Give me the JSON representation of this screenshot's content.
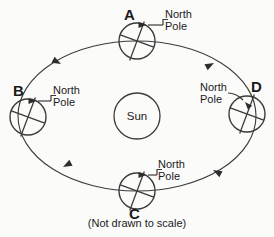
{
  "diagram": {
    "caption": "(Not drawn to scale)",
    "center_body": {
      "label": "Sun",
      "cx": 137,
      "cy": 116,
      "r": 23
    },
    "orbit": {
      "shape": "ellipse",
      "cx": 137,
      "cy": 116,
      "rx": 119,
      "ry": 75,
      "direction": "counterclockwise"
    },
    "positions": [
      {
        "letter": "A",
        "pole_label": "North\nPole",
        "cx": 137,
        "cy": 41,
        "r": 18,
        "letter_x": 124,
        "letter_y": 7,
        "pole_label_x": 165,
        "pole_label_y": 9
      },
      {
        "letter": "B",
        "pole_label": "North\nPole",
        "cx": 28,
        "cy": 117,
        "r": 18,
        "letter_x": 13,
        "letter_y": 83,
        "pole_label_x": 53,
        "pole_label_y": 85
      },
      {
        "letter": "C",
        "pole_label": "North\nPole",
        "cx": 137,
        "cy": 191,
        "r": 18,
        "letter_x": 129,
        "letter_y": 206,
        "pole_label_x": 158,
        "pole_label_y": 159
      },
      {
        "letter": "D",
        "pole_label": "North\nPole",
        "cx": 247,
        "cy": 114,
        "r": 18,
        "letter_x": 251,
        "letter_y": 79,
        "pole_label_x": 200,
        "pole_label_y": 82
      }
    ],
    "orbit_arrows": [
      {
        "name": "arrow-toward-b",
        "x": 61,
        "y": 64,
        "angle": 208
      },
      {
        "name": "arrow-toward-c",
        "x": 63,
        "y": 167,
        "angle": 332
      },
      {
        "name": "arrow-toward-d",
        "x": 213,
        "y": 170,
        "angle": 28
      },
      {
        "name": "arrow-toward-a",
        "x": 214,
        "y": 63,
        "angle": 152
      }
    ],
    "colors": {
      "ink": "#3b3b3b",
      "text": "#1a1a1a",
      "background": "#fbfbfa"
    }
  }
}
